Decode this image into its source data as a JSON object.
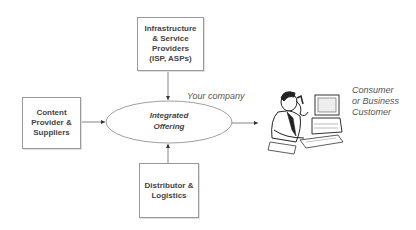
{
  "diagram": {
    "center": {
      "label": "Integrated\nOffering",
      "annotation": "Your company"
    },
    "nodes": [
      {
        "id": "infrastructure",
        "label": "Infrastructure\n& Service\nProviders\n(ISP, ASPs)",
        "position": "top"
      },
      {
        "id": "content",
        "label": "Content\nProvider &\nSuppliers",
        "position": "left"
      },
      {
        "id": "distributor",
        "label": "Distributor &\nLogistics",
        "position": "bottom"
      }
    ],
    "customer": {
      "label": "Consumer\nor Business\nCustomer",
      "icon": "person-at-computer-icon"
    },
    "edges": [
      {
        "from": "infrastructure",
        "to": "center"
      },
      {
        "from": "content",
        "to": "center"
      },
      {
        "from": "distributor",
        "to": "center"
      },
      {
        "from": "center",
        "to": "customer"
      }
    ],
    "colors": {
      "line": "#666666",
      "border": "#9a9a9a",
      "text": "#444444"
    }
  }
}
